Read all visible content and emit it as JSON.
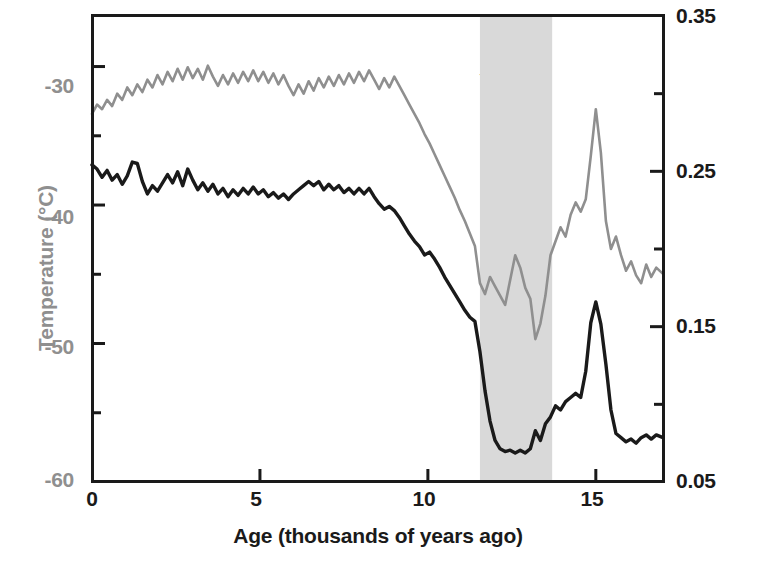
{
  "figure": {
    "annotation": {
      "line1": "Younger",
      "line2": "Dryas"
    }
  },
  "axes": {
    "left": {
      "title": "Temperature (°C)",
      "color": "#8f8f8f",
      "ticks": [
        "-30",
        "-40",
        "-50",
        "-60"
      ]
    },
    "right": {
      "title": "Ice accumulation (metres per year)",
      "color": "#1a1a1a",
      "ticks": [
        "0.35",
        "0.25",
        "0.15",
        "0.05"
      ]
    },
    "bottom": {
      "title": "Age (thousands of years ago)",
      "color": "#1a1a1a",
      "ticks": [
        "0",
        "5",
        "10",
        "15"
      ]
    }
  },
  "chart_data": {
    "type": "line",
    "title": "",
    "xlabel": "Age (thousands of years ago)",
    "ylabel": "Temperature (°C)",
    "y2label": "Ice accumulation (metres per year)",
    "xlim": [
      0,
      17
    ],
    "ylim": [
      -60,
      -26.35
    ],
    "y2lim": [
      0.05,
      0.35
    ],
    "xticks": [
      0,
      5,
      10,
      15
    ],
    "yticks": [
      -30,
      -40,
      -50,
      -60
    ],
    "y2ticks": [
      0.05,
      0.15,
      0.25,
      0.35
    ],
    "x_minor_ticks": true,
    "y_minor_ticks": [
      -35,
      -45,
      -55
    ],
    "y2_minor_ticks": [
      0.1,
      0.2,
      0.3
    ],
    "grid": false,
    "legend": "none",
    "x_direction": "increasing-left-to-right (age increases rightward)",
    "annotations": [
      {
        "text": "Younger Dryas",
        "type": "shaded-band",
        "x_start": 11.55,
        "x_end": 13.7,
        "color": "#d9d9d9"
      }
    ],
    "series": [
      {
        "name": "Temperature",
        "axis": "left",
        "color": "#1a1a1a",
        "units": "°C",
        "x": [
          0.0,
          0.15,
          0.3,
          0.45,
          0.6,
          0.75,
          0.9,
          1.05,
          1.2,
          1.35,
          1.5,
          1.65,
          1.8,
          1.95,
          2.1,
          2.25,
          2.4,
          2.55,
          2.7,
          2.85,
          3.0,
          3.15,
          3.3,
          3.45,
          3.6,
          3.75,
          3.9,
          4.05,
          4.2,
          4.35,
          4.5,
          4.65,
          4.8,
          4.95,
          5.1,
          5.25,
          5.4,
          5.55,
          5.7,
          5.85,
          6.0,
          6.15,
          6.3,
          6.45,
          6.6,
          6.75,
          6.9,
          7.05,
          7.2,
          7.35,
          7.5,
          7.65,
          7.8,
          7.95,
          8.1,
          8.25,
          8.4,
          8.55,
          8.7,
          8.85,
          9.0,
          9.15,
          9.3,
          9.45,
          9.6,
          9.75,
          9.9,
          10.05,
          10.2,
          10.35,
          10.5,
          10.65,
          10.8,
          10.95,
          11.1,
          11.25,
          11.4,
          11.55,
          11.7,
          11.85,
          12.0,
          12.15,
          12.3,
          12.45,
          12.6,
          12.75,
          12.9,
          13.05,
          13.2,
          13.35,
          13.5,
          13.65,
          13.8,
          13.95,
          14.1,
          14.25,
          14.4,
          14.55,
          14.7,
          14.85,
          15.0,
          15.15,
          15.3,
          15.45,
          15.6,
          15.75,
          15.9,
          16.05,
          16.2,
          16.35,
          16.5,
          16.65,
          16.8,
          17.0
        ],
        "y": [
          -37.1,
          -37.4,
          -38.0,
          -37.5,
          -38.2,
          -37.8,
          -38.5,
          -37.9,
          -36.9,
          -37.0,
          -38.3,
          -39.2,
          -38.6,
          -39.0,
          -38.4,
          -37.8,
          -38.4,
          -37.6,
          -38.6,
          -37.4,
          -38.2,
          -38.9,
          -38.4,
          -39.0,
          -38.5,
          -39.2,
          -38.8,
          -39.4,
          -38.9,
          -39.3,
          -38.8,
          -39.2,
          -38.7,
          -39.2,
          -38.9,
          -39.4,
          -39.1,
          -39.5,
          -39.2,
          -39.6,
          -39.2,
          -38.9,
          -38.6,
          -38.3,
          -38.6,
          -38.3,
          -38.9,
          -38.5,
          -38.9,
          -38.6,
          -39.1,
          -38.8,
          -39.2,
          -38.8,
          -39.2,
          -38.8,
          -39.4,
          -39.9,
          -40.3,
          -40.1,
          -40.4,
          -40.9,
          -41.5,
          -42.1,
          -42.6,
          -43.0,
          -43.6,
          -43.4,
          -43.9,
          -44.5,
          -45.2,
          -45.8,
          -46.4,
          -47.0,
          -47.6,
          -48.1,
          -48.4,
          -50.6,
          -53.4,
          -55.6,
          -57.0,
          -57.6,
          -57.8,
          -57.7,
          -57.9,
          -57.7,
          -57.9,
          -57.6,
          -56.3,
          -57.0,
          -55.8,
          -55.3,
          -54.5,
          -54.8,
          -54.2,
          -53.9,
          -53.6,
          -53.9,
          -52.0,
          -48.5,
          -47.0,
          -48.6,
          -51.5,
          -54.8,
          -56.5,
          -56.8,
          -57.1,
          -56.9,
          -57.2,
          -56.8,
          -56.6,
          -56.9,
          -56.6,
          -56.8
        ]
      },
      {
        "name": "Ice accumulation",
        "axis": "right",
        "color": "#8f8f8f",
        "units": "metres per year",
        "x": [
          0.0,
          0.15,
          0.3,
          0.45,
          0.6,
          0.75,
          0.9,
          1.05,
          1.2,
          1.35,
          1.5,
          1.65,
          1.8,
          1.95,
          2.1,
          2.25,
          2.4,
          2.55,
          2.7,
          2.85,
          3.0,
          3.15,
          3.3,
          3.45,
          3.6,
          3.75,
          3.9,
          4.05,
          4.2,
          4.35,
          4.5,
          4.65,
          4.8,
          4.95,
          5.1,
          5.25,
          5.4,
          5.55,
          5.7,
          5.85,
          6.0,
          6.15,
          6.3,
          6.45,
          6.6,
          6.75,
          6.9,
          7.05,
          7.2,
          7.35,
          7.5,
          7.65,
          7.8,
          7.95,
          8.1,
          8.25,
          8.4,
          8.55,
          8.7,
          8.85,
          9.0,
          9.15,
          9.3,
          9.45,
          9.6,
          9.75,
          9.9,
          10.05,
          10.2,
          10.35,
          10.5,
          10.65,
          10.8,
          10.95,
          11.1,
          11.25,
          11.4,
          11.55,
          11.7,
          11.85,
          12.0,
          12.15,
          12.3,
          12.45,
          12.6,
          12.75,
          12.9,
          13.05,
          13.2,
          13.35,
          13.5,
          13.65,
          13.8,
          13.95,
          14.1,
          14.25,
          14.4,
          14.55,
          14.7,
          14.85,
          15.0,
          15.15,
          15.3,
          15.45,
          15.6,
          15.75,
          15.9,
          16.05,
          16.2,
          16.35,
          16.5,
          16.65,
          16.8,
          17.0
        ],
        "y": [
          0.287,
          0.293,
          0.29,
          0.296,
          0.292,
          0.3,
          0.296,
          0.304,
          0.299,
          0.306,
          0.301,
          0.309,
          0.304,
          0.312,
          0.306,
          0.314,
          0.308,
          0.316,
          0.309,
          0.317,
          0.31,
          0.316,
          0.309,
          0.318,
          0.311,
          0.305,
          0.312,
          0.306,
          0.313,
          0.307,
          0.314,
          0.308,
          0.315,
          0.308,
          0.314,
          0.307,
          0.313,
          0.306,
          0.312,
          0.305,
          0.299,
          0.306,
          0.3,
          0.308,
          0.302,
          0.31,
          0.304,
          0.311,
          0.305,
          0.312,
          0.306,
          0.313,
          0.307,
          0.314,
          0.308,
          0.315,
          0.309,
          0.303,
          0.31,
          0.304,
          0.311,
          0.305,
          0.299,
          0.293,
          0.287,
          0.281,
          0.274,
          0.268,
          0.261,
          0.254,
          0.247,
          0.24,
          0.233,
          0.225,
          0.218,
          0.21,
          0.202,
          0.178,
          0.171,
          0.182,
          0.176,
          0.17,
          0.164,
          0.18,
          0.196,
          0.188,
          0.175,
          0.168,
          0.142,
          0.152,
          0.17,
          0.196,
          0.205,
          0.214,
          0.208,
          0.222,
          0.23,
          0.224,
          0.232,
          0.26,
          0.29,
          0.262,
          0.218,
          0.2,
          0.208,
          0.196,
          0.186,
          0.192,
          0.183,
          0.178,
          0.19,
          0.182,
          0.188,
          0.184
        ]
      }
    ]
  }
}
